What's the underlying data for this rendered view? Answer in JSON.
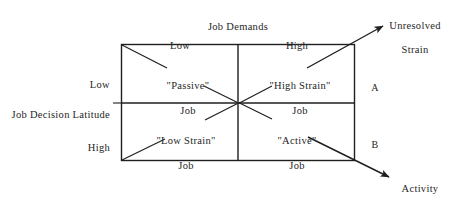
{
  "diagram": {
    "name": "job-demand-control-model",
    "top_axis_title": "Job Demands",
    "left_axis_title": "Job Decision Latitude",
    "top_axis_ticks": [
      {
        "label": "Low"
      },
      {
        "label": "High"
      }
    ],
    "left_axis_ticks": [
      {
        "label": "Low"
      },
      {
        "label": "High"
      }
    ],
    "quadrants": [
      {
        "id": "passive",
        "line1": "\"Passive\"",
        "line2": "Job"
      },
      {
        "id": "high-strain",
        "line1": "\"High Strain\"",
        "line2": "Job"
      },
      {
        "id": "low-strain",
        "line1": "\"Low Strain\"",
        "line2": "Job"
      },
      {
        "id": "active",
        "line1": "\"Active\"",
        "line2": "Job"
      }
    ],
    "region_labels": [
      {
        "id": "a",
        "label": "A"
      },
      {
        "id": "b",
        "label": "B"
      }
    ],
    "outcome_arrows": [
      {
        "id": "unresolved-strain",
        "line1": "Unresolved",
        "line2": "Strain"
      },
      {
        "id": "activity-level",
        "line1": "Activity",
        "line2": "Level"
      }
    ],
    "colors": {
      "background": "#ffffff",
      "stroke": "#1f1f1f",
      "text": "#262626"
    }
  }
}
